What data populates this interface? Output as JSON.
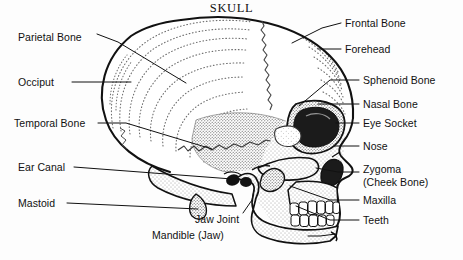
{
  "title": "SKULL",
  "diagram": {
    "ink_color": "#111111",
    "background_color": "#fdfdfd",
    "stipple_color": "#555555"
  },
  "labels_left": [
    {
      "text": "Parietal Bone",
      "x": 18,
      "y": 31
    },
    {
      "text": "Occiput",
      "x": 18,
      "y": 82
    },
    {
      "text": "Temporal Bone",
      "x": 14,
      "y": 123
    },
    {
      "text": "Ear Canal",
      "x": 18,
      "y": 167
    },
    {
      "text": "Mastoid",
      "x": 18,
      "y": 203
    }
  ],
  "labels_right": [
    {
      "text": "Frontal Bone",
      "x": 345,
      "y": 22
    },
    {
      "text": "Forehead",
      "x": 345,
      "y": 48
    },
    {
      "text": "Sphenoid Bone",
      "x": 363,
      "y": 79
    },
    {
      "text": "Nasal Bone",
      "x": 363,
      "y": 103
    },
    {
      "text": "Eye Socket",
      "x": 363,
      "y": 122
    },
    {
      "text": "Nose",
      "x": 363,
      "y": 145
    },
    {
      "text": "Zygoma",
      "x": 363,
      "y": 168
    },
    {
      "text": "(Cheek Bone)",
      "x": 363,
      "y": 181
    },
    {
      "text": "Maxilla",
      "x": 363,
      "y": 199
    },
    {
      "text": "Teeth",
      "x": 363,
      "y": 219
    }
  ],
  "labels_bottom": [
    {
      "text": "Jaw Joint",
      "x": 195,
      "y": 219
    },
    {
      "text": "Mandible (Jaw)",
      "x": 152,
      "y": 234
    }
  ],
  "parts": [
    "Parietal Bone",
    "Occiput",
    "Temporal Bone",
    "Ear Canal",
    "Mastoid",
    "Frontal Bone",
    "Forehead",
    "Sphenoid Bone",
    "Nasal Bone",
    "Eye Socket",
    "Nose",
    "Zygoma (Cheek Bone)",
    "Maxilla",
    "Teeth",
    "Jaw Joint",
    "Mandible (Jaw)"
  ]
}
